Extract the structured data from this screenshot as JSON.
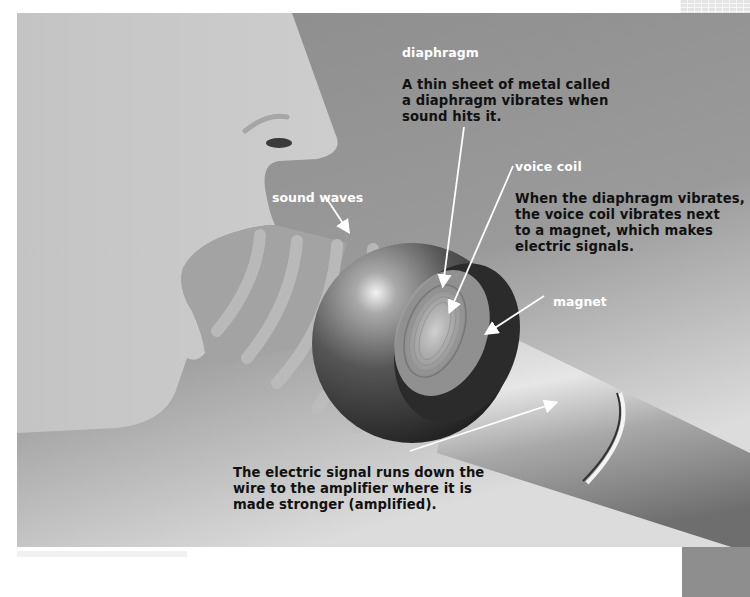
{
  "diagram": {
    "palette": {
      "background_dark": "#8a8a8a",
      "face": "#c8c8c8",
      "mouth": "#a4a4a4",
      "waves": "#b8b8b8",
      "sphere_dark": "#2a2a2a",
      "handle_light": "#d8d8d8",
      "label_title": "#ffffff",
      "label_text": "#111111"
    },
    "labels": {
      "diaphragm": {
        "title": "diaphragm",
        "body": "A thin sheet of metal called\na diaphragm vibrates when\nsound hits it."
      },
      "voice_coil": {
        "title": "voice coil",
        "body": "When the diaphragm vibrates,\nthe voice coil vibrates next\nto a magnet, which makes\nelectric signals."
      },
      "sound_waves": {
        "title": "sound waves"
      },
      "magnet": {
        "title": "magnet"
      },
      "signal": {
        "body": "The electric signal runs down the\nwire to the amplifier where it is\nmade stronger (amplified)."
      }
    }
  }
}
